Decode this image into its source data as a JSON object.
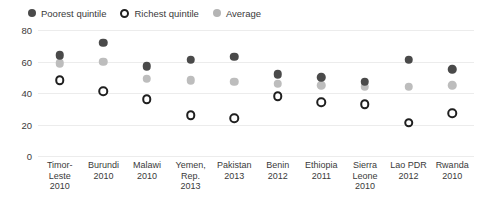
{
  "legend": {
    "position": "top-left",
    "items": [
      {
        "key": "poorest",
        "label": "Poorest quintile",
        "marker": "filled-dark-dot",
        "color": "#4a4a4a"
      },
      {
        "key": "richest",
        "label": "Richest quintile",
        "marker": "hollow-ringed-dot",
        "color": "#1f1f1f"
      },
      {
        "key": "average",
        "label": "Average",
        "marker": "filled-gray-dot",
        "color": "#bdbdbd"
      }
    ]
  },
  "axis": {
    "y_ticks": [
      "0",
      "20",
      "40",
      "60",
      "80"
    ],
    "y_min": 0,
    "y_max": 80
  },
  "chart_data": {
    "type": "scatter",
    "title": "",
    "subtitle": "",
    "xlabel": "",
    "ylabel": "",
    "ylim": [
      0,
      80
    ],
    "yticks": [
      0,
      20,
      40,
      60,
      80
    ],
    "grid": true,
    "legend_position": "top-left",
    "categories": [
      "Timor-Leste 2010",
      "Burundi 2010",
      "Malawi 2010",
      "Yemen, Rep. 2013",
      "Pakistan 2013",
      "Benin 2012",
      "Ethiopia 2011",
      "Sierra Leone 2010",
      "Lao PDR 2012",
      "Rwanda 2010"
    ],
    "category_lines": [
      [
        "Timor-",
        "Leste",
        "2010"
      ],
      [
        "Burundi",
        "2010"
      ],
      [
        "Malawi",
        "2010"
      ],
      [
        "Yemen,",
        "Rep.",
        "2013"
      ],
      [
        "Pakistan",
        "2013"
      ],
      [
        "Benin",
        "2012"
      ],
      [
        "Ethiopia",
        "2011"
      ],
      [
        "Sierra",
        "Leone",
        "2010"
      ],
      [
        "Lao PDR",
        "2012"
      ],
      [
        "Rwanda",
        "2010"
      ]
    ],
    "series": [
      {
        "name": "Poorest quintile",
        "color": "#4a4a4a",
        "values": [
          64,
          72,
          57,
          61,
          63,
          52,
          50,
          47,
          61,
          55
        ]
      },
      {
        "name": "Richest quintile",
        "color": "#1f1f1f",
        "values": [
          48,
          41,
          36,
          26,
          24,
          38,
          34,
          33,
          21,
          27
        ]
      },
      {
        "name": "Average",
        "color": "#bdbdbd",
        "values": [
          59,
          60,
          49,
          48,
          47,
          46,
          45,
          44,
          44,
          45
        ]
      }
    ]
  }
}
